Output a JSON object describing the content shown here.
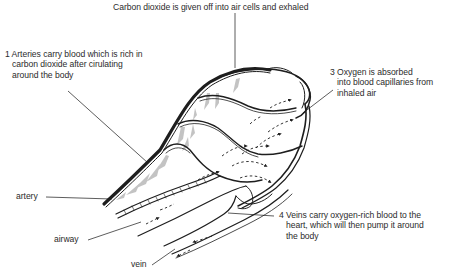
{
  "diagram": {
    "labels": {
      "top": {
        "text": "Carbon dioxide is given off into air cells and exhaled"
      },
      "step1": {
        "number": "1",
        "lines": [
          "Arteries carry blood which is rich in",
          "carbon dioxide after cirulating",
          "around the body"
        ]
      },
      "step3": {
        "number": "3",
        "lines": [
          "Oxygen is absorbed",
          "into blood capillaries from",
          "inhaled air"
        ]
      },
      "step4": {
        "number": "4",
        "lines": [
          "Veins carry oxygen-rich blood to the",
          "heart, which will then pump it around",
          "the body"
        ]
      },
      "artery": {
        "text": "artery"
      },
      "airway": {
        "text": "airway"
      },
      "vein": {
        "text": "vein"
      }
    },
    "colors": {
      "ink": "#1e1e1e",
      "text": "#2b2b2b",
      "shading": "#b8b8b8",
      "background": "#ffffff"
    }
  }
}
